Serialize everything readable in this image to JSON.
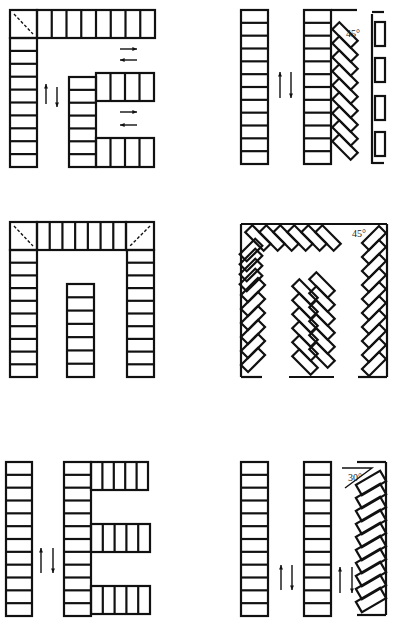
{
  "diagram": {
    "title": "",
    "panels": [
      {
        "id": "p1",
        "layout": "L-shaped perpendicular with T-branch",
        "angle_label": ""
      },
      {
        "id": "p2",
        "layout": "perpendicular + 45° angled",
        "angle_label": "45°"
      },
      {
        "id": "p3",
        "layout": "U-shaped perpendicular with center row",
        "angle_label": ""
      },
      {
        "id": "p4",
        "layout": "45° herringbone loop",
        "angle_label": "45°"
      },
      {
        "id": "p5",
        "layout": "E-shaped perpendicular",
        "angle_label": ""
      },
      {
        "id": "p6",
        "layout": "perpendicular + 30° angled",
        "angle_label": "30°"
      }
    ]
  }
}
